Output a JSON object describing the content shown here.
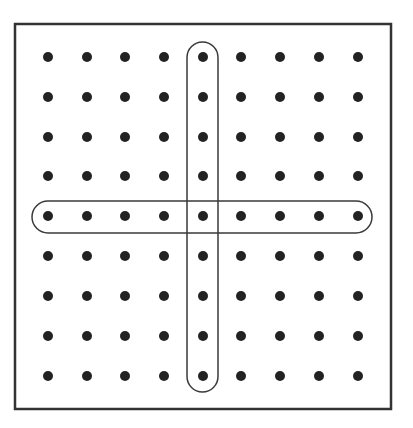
{
  "diagram": {
    "canvas": {
      "width": 413,
      "height": 428
    },
    "colors": {
      "background": "#ffffff",
      "frame": "#333333",
      "dot": "#222222",
      "pill": "#3a3a3a"
    },
    "frame": {
      "x": 15,
      "y": 24,
      "width": 376,
      "height": 385,
      "stroke_width": 2.5
    },
    "grid": {
      "rows": 9,
      "cols": 9,
      "x_positions": [
        48,
        87,
        125,
        164,
        203,
        241,
        280,
        319,
        358
      ],
      "y_positions": [
        57,
        97,
        137,
        176,
        216,
        256,
        296,
        336,
        376
      ],
      "dot_radius": 5
    },
    "highlights": [
      {
        "name": "vertical-pill",
        "orientation": "column",
        "index": 4,
        "x": 187,
        "y": 42,
        "width": 31,
        "height": 350,
        "radius": 15.5
      },
      {
        "name": "horizontal-pill",
        "orientation": "row",
        "index": 4,
        "x": 32,
        "y": 201,
        "width": 340,
        "height": 32,
        "radius": 16
      }
    ]
  }
}
